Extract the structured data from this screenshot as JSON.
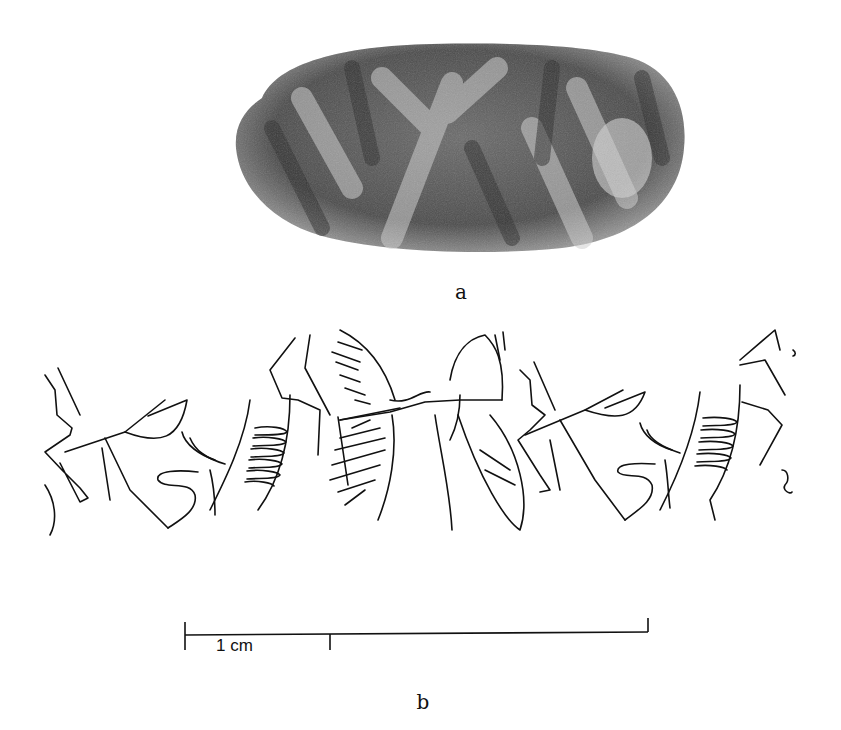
{
  "figure": {
    "panel_a": {
      "label": "a",
      "content": "photograph of seal impression fragment (grayscale)"
    },
    "panel_b": {
      "label": "b",
      "content": "line drawing of rolled-out cylinder seal impression: repeating animal/bird figures with spread wings, legs, comb-like striations"
    },
    "scale_bar": {
      "label": "1 cm",
      "unit": "cm",
      "major_tick_value": 1
    },
    "colors": {
      "background": "#ffffff",
      "ink": "#111111",
      "photo_dark": "#3a3a3a",
      "photo_light": "#c9c9c9"
    }
  }
}
